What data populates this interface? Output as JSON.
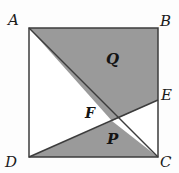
{
  "figure": {
    "kind": "geometry-diagram",
    "canvas": {
      "width": 179,
      "height": 173
    },
    "colors": {
      "background": "#fdfdfd",
      "shaded_fill": "#9a9a9a",
      "unshaded_fill": "#ffffff",
      "stroke": "#3c3c3c",
      "label_text": "#141414"
    },
    "stroke_width": 1.5,
    "points": {
      "A": {
        "label": "A",
        "x": 29,
        "y": 28
      },
      "B": {
        "label": "B",
        "x": 158,
        "y": 28
      },
      "C": {
        "label": "C",
        "x": 158,
        "y": 157
      },
      "D": {
        "label": "D",
        "x": 29,
        "y": 157
      },
      "E": {
        "label": "E",
        "x": 158,
        "y": 100
      },
      "F": {
        "label": "F",
        "x": 112,
        "y": 121
      }
    },
    "segments": [
      {
        "name": "side-AB",
        "from": "A",
        "to": "B"
      },
      {
        "name": "side-BC",
        "from": "B",
        "to": "C"
      },
      {
        "name": "side-CD",
        "from": "C",
        "to": "D"
      },
      {
        "name": "side-DA",
        "from": "D",
        "to": "A"
      },
      {
        "name": "diagonal-AC",
        "from": "A",
        "to": "C"
      },
      {
        "name": "segment-DE",
        "from": "D",
        "to": "E"
      }
    ],
    "regions": [
      {
        "name": "region-Q",
        "label": "Q",
        "shaded": true,
        "vertices": [
          "A",
          "B",
          "E",
          "F"
        ],
        "label_position": {
          "x": 112,
          "y": 60
        }
      },
      {
        "name": "region-P",
        "label": "P",
        "shaded": true,
        "vertices": [
          "D",
          "F",
          "C"
        ],
        "label_position": {
          "x": 113,
          "y": 140
        }
      },
      {
        "name": "region-ADF",
        "label": "",
        "shaded": false,
        "vertices": [
          "A",
          "D",
          "F"
        ],
        "label_position": null
      },
      {
        "name": "region-FEC",
        "label": "",
        "shaded": false,
        "vertices": [
          "F",
          "E",
          "C"
        ],
        "label_position": null
      }
    ]
  }
}
